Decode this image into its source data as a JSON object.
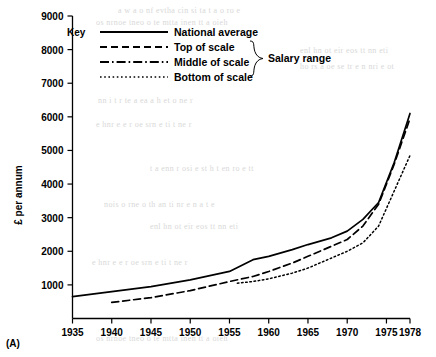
{
  "figure": {
    "panel_label": "(A)"
  },
  "legend": {
    "key_label": "Key",
    "group_label": "Salary range",
    "entries": [
      {
        "label": "National average",
        "style": "solid"
      },
      {
        "label": "Top of scale",
        "style": "dashed"
      },
      {
        "label": "Middle of scale",
        "style": "dashdot"
      },
      {
        "label": "Bottom of scale",
        "style": "dotted"
      }
    ]
  },
  "chart_data": {
    "type": "line",
    "title": "",
    "xlabel": "",
    "ylabel": "£ per annum",
    "xlim": [
      1935,
      1978
    ],
    "ylim": [
      0,
      9000
    ],
    "grid": false,
    "legend_position": "top-left-inside",
    "xticks": [
      1935,
      1940,
      1945,
      1950,
      1955,
      1960,
      1965,
      1970,
      1975,
      1978
    ],
    "xtick_labels": [
      "1935",
      "1940",
      "1945",
      "1950",
      "1955",
      "1960",
      "1965",
      "1970",
      "1975",
      "1978"
    ],
    "yticks": [
      1000,
      2000,
      3000,
      4000,
      5000,
      6000,
      7000,
      8000,
      9000
    ],
    "ytick_labels": [
      "1000",
      "2000",
      "3000",
      "4000",
      "5000",
      "6000",
      "7000",
      "8000",
      "9000"
    ],
    "series": [
      {
        "name": "National average",
        "style": "solid",
        "x": [
          1935,
          1940,
          1945,
          1950,
          1955,
          1958,
          1960,
          1963,
          1965,
          1968,
          1970,
          1972,
          1974,
          1976,
          1978
        ],
        "values": [
          650,
          800,
          950,
          1150,
          1400,
          1750,
          1850,
          2050,
          2200,
          2400,
          2600,
          2950,
          3450,
          4650,
          6100
        ]
      },
      {
        "name": "Top of scale",
        "style": "dashed",
        "x": [
          1940,
          1945,
          1950,
          1955,
          1958,
          1960,
          1963,
          1965,
          1968,
          1970,
          1972,
          1974,
          1976,
          1978
        ],
        "values": [
          480,
          620,
          830,
          1100,
          1250,
          1400,
          1650,
          1850,
          2150,
          2350,
          2750,
          3400,
          4600,
          5950
        ]
      },
      {
        "name": "Bottom of scale",
        "style": "dotted",
        "x": [
          1956,
          1958,
          1960,
          1963,
          1965,
          1968,
          1970,
          1972,
          1974,
          1976,
          1978
        ],
        "values": [
          1050,
          1100,
          1180,
          1350,
          1500,
          1800,
          2000,
          2250,
          2750,
          3800,
          4850
        ]
      }
    ]
  },
  "ghost_text": {
    "note": "faint scanned page text showing through from reverse side",
    "lines": [
      "a w a    o nf  evtha   cin  si   ta   t a o   ro  e",
      "os   nrnoe tneo o te   mtta  inen tt a  oieh",
      "enl  hn  ot  eir  eos     tt nn   eti",
      "ho   rs   a oe   se  tr  e  n  nri e  ot",
      "nn i  t  r  te  a  ea a  h  et o ne r",
      "e  hnr  e e r oe  srn    e ti  t  ne  r",
      "t a  enn   r osi  e  st h t  en  ro  e  tt",
      "nois  o  rne o th an ti nr  e  n  a  t e"
    ]
  }
}
